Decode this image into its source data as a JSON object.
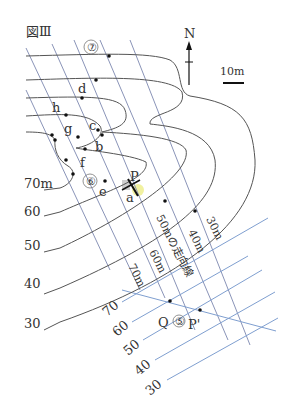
{
  "figure": {
    "title": "図Ⅲ",
    "north_label": "N",
    "scale_label": "10m",
    "colors": {
      "contour": "#555555",
      "strike_line": "#8a94b8",
      "strike_line_lower": "#7f9fd0",
      "highlight": "#e8e86a",
      "text": "#333333"
    },
    "contour_labels": [
      "70m",
      "60",
      "50",
      "40",
      "30"
    ],
    "route_numbers": [
      "⑦",
      "⑥",
      "⑤"
    ],
    "points": [
      "a",
      "b",
      "c",
      "d",
      "e",
      "f",
      "g",
      "h",
      "P",
      "Q",
      "P'"
    ],
    "strike_line_labels": [
      "30m",
      "40m",
      "50mの走向線",
      "60m",
      "70m"
    ],
    "lower_scale_labels": [
      "70",
      "60",
      "50",
      "40",
      "30"
    ]
  }
}
